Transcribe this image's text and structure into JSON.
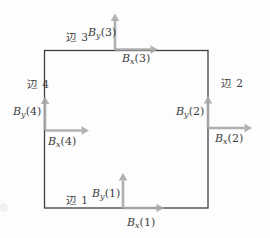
{
  "figure": {
    "background": "#fdfdfd",
    "colors": {
      "line": "#3e3e3e",
      "arrow": "#a8a8a8",
      "text": "#3c3c3c"
    },
    "square": {
      "x": 44.5,
      "y": 50.5,
      "width": 163.5,
      "height": 157.5
    },
    "arrow_style": {
      "shaft_width": 2.6,
      "head_length": 7.5,
      "head_half_width": 4.3,
      "opacity": 0.9
    },
    "frames": [
      {
        "id": 1,
        "edge_label": "辺 1",
        "edge_label_pos": {
          "x": 66,
          "y": 194
        },
        "origin": {
          "x": 123,
          "y": 208
        },
        "arrow_up_len": 35,
        "arrow_right_len": 41,
        "by_label": {
          "base": "B",
          "sub": "y",
          "arg": "(1)",
          "x": 92,
          "y": 187
        },
        "bx_label": {
          "base": "B",
          "sub": "x",
          "arg": "(1)",
          "x": 127,
          "y": 216
        }
      },
      {
        "id": 2,
        "edge_label": "辺 2",
        "edge_label_pos": {
          "x": 221,
          "y": 77
        },
        "origin": {
          "x": 208,
          "y": 128
        },
        "arrow_up_len": 32,
        "arrow_right_len": 44,
        "by_label": {
          "base": "B",
          "sub": "y",
          "arg": "(2)",
          "x": 176,
          "y": 105
        },
        "bx_label": {
          "base": "B",
          "sub": "x",
          "arg": "(2)",
          "x": 215,
          "y": 132
        }
      },
      {
        "id": 3,
        "edge_label": "辺 3",
        "edge_label_pos": {
          "x": 66,
          "y": 31
        },
        "origin": {
          "x": 115,
          "y": 49.5
        },
        "arrow_up_len": 36,
        "arrow_right_len": 43,
        "by_label": {
          "base": "B",
          "sub": "y",
          "arg": "(3)",
          "x": 88,
          "y": 26
        },
        "bx_label": {
          "base": "B",
          "sub": "x",
          "arg": "(3)",
          "x": 122,
          "y": 52
        }
      },
      {
        "id": 4,
        "edge_label": "辺 4",
        "edge_label_pos": {
          "x": 27,
          "y": 78
        },
        "origin": {
          "x": 45,
          "y": 130.5
        },
        "arrow_up_len": 34,
        "arrow_right_len": 44,
        "by_label": {
          "base": "B",
          "sub": "y",
          "arg": "(4)",
          "x": 13,
          "y": 105
        },
        "bx_label": {
          "base": "B",
          "sub": "x",
          "arg": "(4)",
          "x": 48,
          "y": 135
        }
      }
    ]
  }
}
